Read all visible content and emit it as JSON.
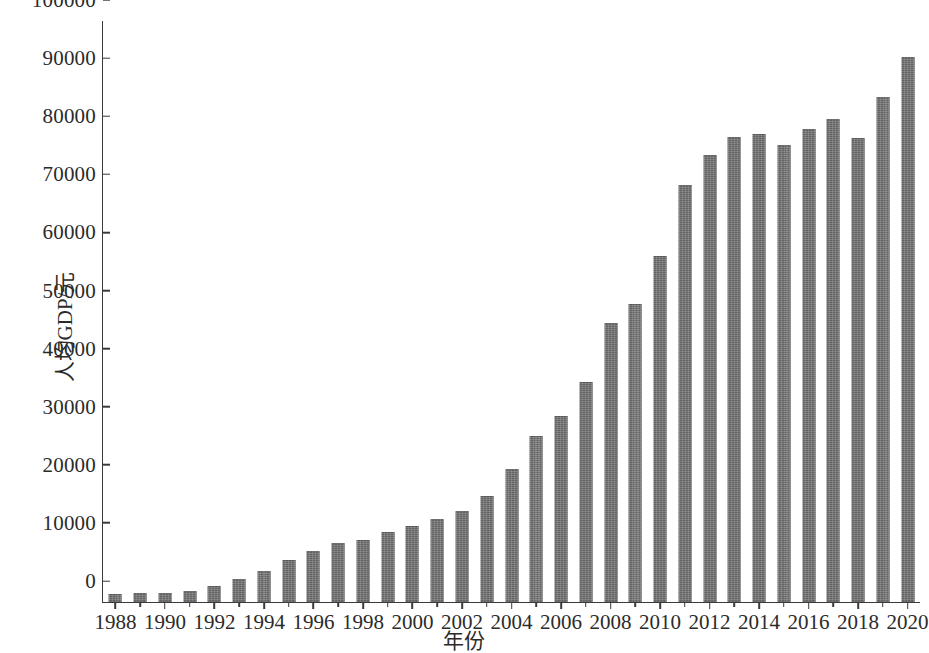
{
  "chart_data": {
    "type": "bar",
    "title": "",
    "xlabel": "年份",
    "ylabel": "人均GDP/元",
    "ylim": [
      0,
      100000
    ],
    "xlim": [
      1987.5,
      2020.5
    ],
    "grid": false,
    "legend": null,
    "bar_color": "#6f6f6f",
    "axis_color": "#3a3a3a",
    "y_ticks": [
      0,
      10000,
      20000,
      30000,
      40000,
      50000,
      60000,
      70000,
      80000,
      90000,
      100000
    ],
    "y_tick_labels": [
      "0",
      "10000",
      "20000",
      "30000",
      "40000",
      "50000",
      "60000",
      "70000",
      "80000",
      "90000",
      "100000"
    ],
    "x_ticks": [
      1988,
      1990,
      1992,
      1994,
      1996,
      1998,
      2000,
      2002,
      2004,
      2006,
      2008,
      2010,
      2012,
      2014,
      2016,
      2018,
      2020
    ],
    "x_tick_labels": [
      "1988",
      "1990",
      "1992",
      "1994",
      "1996",
      "1998",
      "2000",
      "2002",
      "2004",
      "2006",
      "2008",
      "2010",
      "2012",
      "2014",
      "2016",
      "2018",
      "2020"
    ],
    "categories": [
      1988,
      1989,
      1990,
      1991,
      1992,
      1993,
      1994,
      1995,
      1996,
      1997,
      1998,
      1999,
      2000,
      2001,
      2002,
      2003,
      2004,
      2005,
      2006,
      2007,
      2008,
      2009,
      2010,
      2011,
      2012,
      2013,
      2014,
      2015,
      2016,
      2017,
      2018,
      2019,
      2020
    ],
    "values": [
      1400,
      1500,
      1600,
      1900,
      2700,
      4000,
      5400,
      7200,
      8700,
      10200,
      10700,
      12100,
      13100,
      14300,
      15600,
      18300,
      22900,
      28500,
      32100,
      37900,
      48000,
      51300,
      59500,
      71800,
      76900,
      80000,
      80600,
      78700,
      81400,
      83200,
      79900,
      87000,
      93800
    ]
  }
}
